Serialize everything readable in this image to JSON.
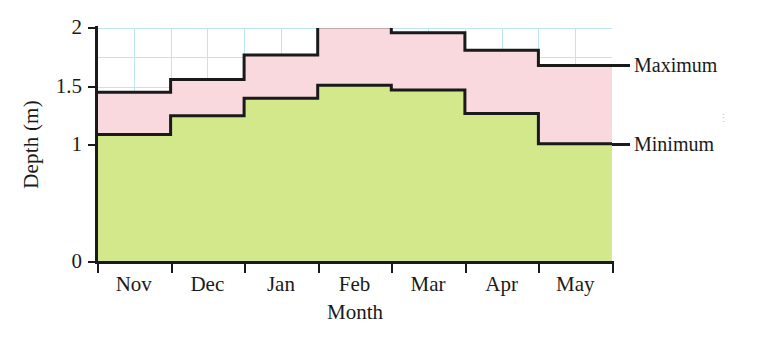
{
  "chart_data": {
    "type": "area",
    "title": "",
    "xlabel": "Month",
    "ylabel": "Depth (m)",
    "categories": [
      "Nov",
      "Dec",
      "Jan",
      "Feb",
      "Mar",
      "Apr",
      "May"
    ],
    "series": [
      {
        "name": "Maximum",
        "values": [
          1.45,
          1.56,
          1.77,
          2.01,
          1.96,
          1.81,
          1.68
        ],
        "fill_color": "#f9d9de"
      },
      {
        "name": "Minimum",
        "values": [
          1.09,
          1.25,
          1.4,
          1.51,
          1.47,
          1.27,
          1.01
        ],
        "fill_color": "#d2e88a"
      }
    ],
    "ylim": [
      0,
      2
    ],
    "xlim": [
      0,
      7
    ],
    "y_tick_labels": [
      "0",
      "1",
      "1.5",
      "2"
    ],
    "y_tick_values": [
      0,
      1,
      1.5,
      2
    ],
    "grid": true,
    "grid_color": "#bfe4f2",
    "grid_y_step": 0.25,
    "grid_x_per_category": 2,
    "legend_position": "right-inline",
    "line_color": "#1a1a1a",
    "step_style": "step-post"
  },
  "axis": {
    "y_title": "Depth (m)",
    "x_title": "Month"
  },
  "legend": {
    "maximum_label": "Maximum",
    "minimum_label": "Minimum"
  }
}
